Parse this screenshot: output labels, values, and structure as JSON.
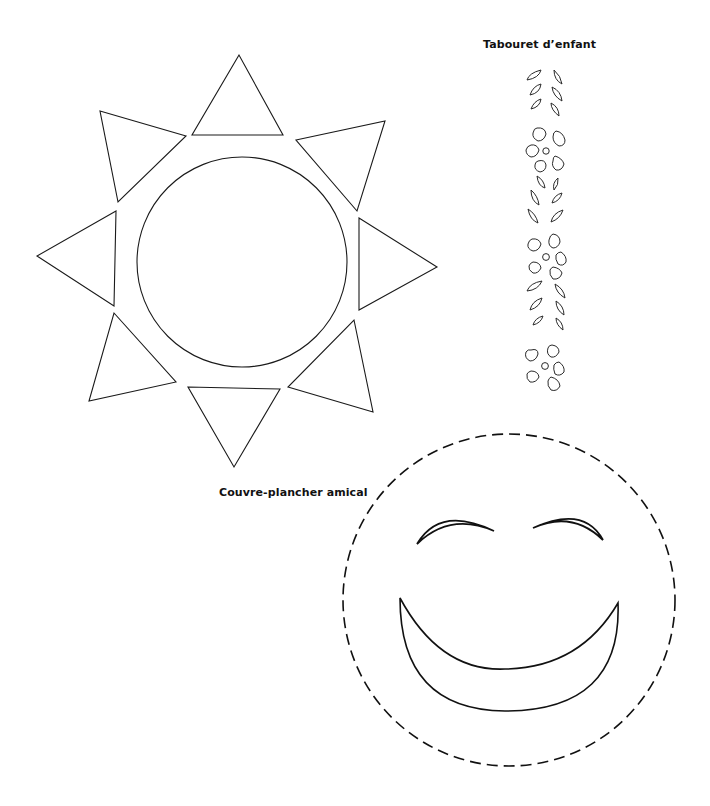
{
  "labels": {
    "stool": "Tabouret d’enfant",
    "rug": "Couvre-plancher amical"
  },
  "colors": {
    "background": "#ffffff",
    "line": "#1a1a1a",
    "text": "#111111"
  },
  "figures": {
    "sun": {
      "name": "sun-pattern",
      "circle": {
        "cx": 242,
        "cy": 262,
        "r": 105
      },
      "rays": [
        "239,55 192,135 283,135",
        "296,140 385,121 357,211",
        "359,218 437,267 359,310",
        "354,320 373,412 288,387",
        "188,387 280,389 234,467",
        "114,313 176,382 89,401",
        "116,211 37,256 114,306",
        "100,111 186,136 118,202"
      ]
    },
    "stool": {
      "name": "stool-leaf-flower-pattern"
    },
    "smiley": {
      "name": "smiley-rug-pattern",
      "circle": {
        "cx": 509,
        "cy": 600,
        "r": 166
      }
    }
  }
}
